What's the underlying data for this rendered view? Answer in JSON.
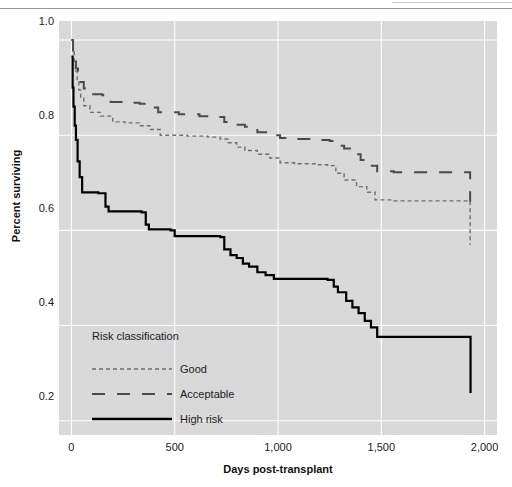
{
  "figure": {
    "background": "#ffffff",
    "panel_background": "#d9d9d9",
    "grid_color": "#ffffff"
  },
  "chart_data": {
    "type": "line",
    "subtype": "kaplan-meier-step",
    "title": "",
    "xlabel": "Days post-transplant",
    "ylabel": "Percent surviving",
    "xlim": [
      -60,
      2060
    ],
    "ylim": [
      0.17,
      1.04
    ],
    "xticks": [
      0,
      500,
      1000,
      1500,
      2000
    ],
    "xticklabels": [
      "0",
      "500",
      "1,000",
      "1,500",
      "2,000"
    ],
    "yticks": [
      0.2,
      0.4,
      0.6,
      0.8,
      1.0
    ],
    "yticklabels": [
      "0.2",
      "0.4",
      "0.6",
      "0.8",
      "1.0"
    ],
    "grid": true,
    "grid_axis": "both",
    "legend": {
      "title": "Risk classification",
      "position": "inside-lower-left",
      "entries": [
        {
          "label": "Good",
          "style": "dotted",
          "color": "#6e6e6e",
          "width": 1.4
        },
        {
          "label": "Acceptable",
          "style": "long-dash",
          "color": "#4a4a4a",
          "width": 2.0
        },
        {
          "label": "High risk",
          "style": "solid",
          "color": "#000000",
          "width": 2.2
        }
      ]
    },
    "series": [
      {
        "name": "Good",
        "style": "dotted",
        "color": "#6e6e6e",
        "width": 1.4,
        "points": [
          [
            0,
            1.0
          ],
          [
            8,
            0.975
          ],
          [
            14,
            0.955
          ],
          [
            20,
            0.935
          ],
          [
            28,
            0.915
          ],
          [
            36,
            0.895
          ],
          [
            45,
            0.878
          ],
          [
            60,
            0.862
          ],
          [
            90,
            0.848
          ],
          [
            140,
            0.84
          ],
          [
            200,
            0.828
          ],
          [
            260,
            0.826
          ],
          [
            330,
            0.82
          ],
          [
            380,
            0.812
          ],
          [
            430,
            0.8
          ],
          [
            560,
            0.798
          ],
          [
            660,
            0.796
          ],
          [
            720,
            0.792
          ],
          [
            760,
            0.784
          ],
          [
            800,
            0.775
          ],
          [
            840,
            0.768
          ],
          [
            900,
            0.76
          ],
          [
            960,
            0.752
          ],
          [
            1010,
            0.742
          ],
          [
            1080,
            0.74
          ],
          [
            1180,
            0.738
          ],
          [
            1240,
            0.736
          ],
          [
            1280,
            0.72
          ],
          [
            1320,
            0.706
          ],
          [
            1380,
            0.692
          ],
          [
            1430,
            0.68
          ],
          [
            1470,
            0.664
          ],
          [
            1560,
            0.662
          ],
          [
            1700,
            0.662
          ],
          [
            1860,
            0.662
          ],
          [
            1925,
            0.662
          ],
          [
            1930,
            0.57
          ]
        ]
      },
      {
        "name": "Acceptable",
        "style": "long-dash",
        "color": "#4a4a4a",
        "width": 2.0,
        "points": [
          [
            0,
            1.0
          ],
          [
            8,
            0.978
          ],
          [
            14,
            0.958
          ],
          [
            22,
            0.94
          ],
          [
            32,
            0.925
          ],
          [
            44,
            0.912
          ],
          [
            60,
            0.898
          ],
          [
            90,
            0.886
          ],
          [
            150,
            0.884
          ],
          [
            190,
            0.87
          ],
          [
            260,
            0.868
          ],
          [
            330,
            0.866
          ],
          [
            370,
            0.858
          ],
          [
            420,
            0.848
          ],
          [
            520,
            0.844
          ],
          [
            620,
            0.84
          ],
          [
            700,
            0.838
          ],
          [
            740,
            0.828
          ],
          [
            790,
            0.822
          ],
          [
            840,
            0.818
          ],
          [
            900,
            0.806
          ],
          [
            960,
            0.8
          ],
          [
            1010,
            0.794
          ],
          [
            1080,
            0.792
          ],
          [
            1180,
            0.79
          ],
          [
            1250,
            0.788
          ],
          [
            1290,
            0.778
          ],
          [
            1320,
            0.772
          ],
          [
            1360,
            0.76
          ],
          [
            1400,
            0.748
          ],
          [
            1440,
            0.736
          ],
          [
            1480,
            0.724
          ],
          [
            1560,
            0.722
          ],
          [
            1700,
            0.722
          ],
          [
            1860,
            0.722
          ],
          [
            1925,
            0.722
          ],
          [
            1930,
            0.66
          ]
        ]
      },
      {
        "name": "High risk",
        "style": "solid",
        "color": "#000000",
        "width": 2.2,
        "points": [
          [
            0,
            0.965
          ],
          [
            6,
            0.9
          ],
          [
            10,
            0.86
          ],
          [
            16,
            0.82
          ],
          [
            22,
            0.79
          ],
          [
            30,
            0.745
          ],
          [
            40,
            0.712
          ],
          [
            52,
            0.68
          ],
          [
            130,
            0.678
          ],
          [
            165,
            0.65
          ],
          [
            180,
            0.64
          ],
          [
            340,
            0.638
          ],
          [
            360,
            0.612
          ],
          [
            375,
            0.602
          ],
          [
            480,
            0.6
          ],
          [
            500,
            0.588
          ],
          [
            720,
            0.586
          ],
          [
            740,
            0.56
          ],
          [
            770,
            0.548
          ],
          [
            800,
            0.542
          ],
          [
            830,
            0.53
          ],
          [
            860,
            0.524
          ],
          [
            900,
            0.512
          ],
          [
            940,
            0.506
          ],
          [
            980,
            0.498
          ],
          [
            1240,
            0.496
          ],
          [
            1270,
            0.482
          ],
          [
            1290,
            0.47
          ],
          [
            1330,
            0.452
          ],
          [
            1360,
            0.438
          ],
          [
            1390,
            0.426
          ],
          [
            1420,
            0.41
          ],
          [
            1450,
            0.396
          ],
          [
            1480,
            0.376
          ],
          [
            1600,
            0.376
          ],
          [
            1760,
            0.376
          ],
          [
            1900,
            0.376
          ],
          [
            1928,
            0.376
          ],
          [
            1932,
            0.258
          ]
        ]
      }
    ]
  }
}
